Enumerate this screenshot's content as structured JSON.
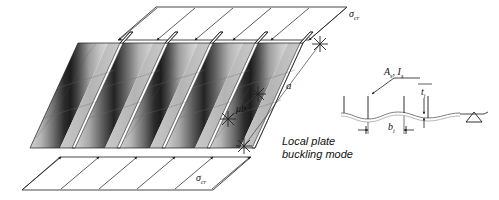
{
  "figure": {
    "caption_line1": "Local plate",
    "caption_line2": "buckling mode",
    "labels": {
      "sigma_cr_top": "σ",
      "sigma_cr_top_sub": "cr",
      "sigma_cr_bottom": "σ",
      "sigma_cr_bottom_sub": "cr",
      "length_a": "a",
      "width_mub": "μb",
      "section_area_inertia": "A",
      "section_area_inertia_sub": "s",
      "section_area_inertia_2": ", I",
      "section_area_inertia_2_sub": "s",
      "thickness_ti": "t",
      "thickness_ti_sub": "i",
      "width_bi": "b",
      "width_bi_sub": "i"
    },
    "colors": {
      "line": "#1a1a1a",
      "plate_light": "#d9d9d9",
      "plate_mid": "#9a9a9a",
      "plate_dark": "#2e2e2e",
      "background": "#ffffff",
      "dimension_line": "#555555"
    },
    "geometry": {
      "panel_count": 5,
      "arrow_count_top": 6,
      "arrow_count_bottom": 6,
      "stiffener_count_section": 4,
      "support_symbol": "roller-triangle"
    }
  }
}
